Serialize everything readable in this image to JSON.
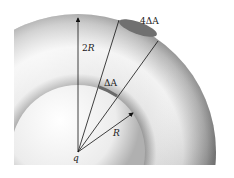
{
  "diagram": {
    "labels": {
      "outer_radius": "2R",
      "inner_radius": "R",
      "inner_area": "ΔA",
      "outer_area": "4ΔA",
      "charge": "q"
    },
    "colors": {
      "sphere_light": "#f4f4f4",
      "sphere_dark": "#8a8a8a",
      "patch": "#6e6e6e",
      "line": "#111111",
      "background": "#ffffff"
    }
  }
}
